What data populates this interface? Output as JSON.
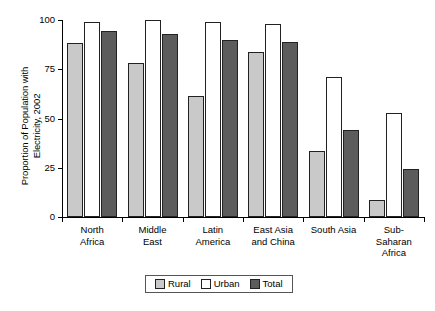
{
  "chart_data": {
    "type": "bar",
    "title": "",
    "xlabel": "",
    "ylabel": "Proportion of Population with\nElectricity, 2002",
    "ylim": [
      0,
      100
    ],
    "yticks": [
      0,
      25,
      50,
      75,
      100
    ],
    "ytick_labels": [
      "0",
      "25",
      "50",
      "75",
      "100"
    ],
    "grid": false,
    "legend_position": "bottom-center",
    "categories": [
      "North\nAfrica",
      "Middle\nEast",
      "Latin\nAmerica",
      "East Asia\nand China",
      "South Asia",
      "Sub-\nSaharan\nAfrica"
    ],
    "series": [
      {
        "name": "Rural",
        "color": "#c9c9c9",
        "values": [
          88.5,
          78,
          61.5,
          84,
          33.5,
          8.5
        ]
      },
      {
        "name": "Urban",
        "color": "#ffffff",
        "values": [
          99,
          100,
          99,
          98,
          71,
          53
        ]
      },
      {
        "name": "Total",
        "color": "#5c5c5c",
        "values": [
          94.5,
          93,
          90,
          89,
          44,
          24.5
        ]
      }
    ]
  },
  "legend": {
    "items": [
      {
        "label": "Rural",
        "swatch": "rural"
      },
      {
        "label": "Urban",
        "swatch": "urban"
      },
      {
        "label": "Total",
        "swatch": "total"
      }
    ]
  }
}
